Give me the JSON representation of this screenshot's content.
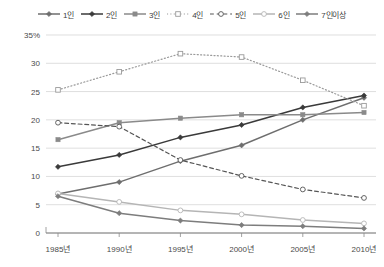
{
  "chart_data": {
    "type": "line",
    "title": "",
    "xlabel": "",
    "ylabel": "",
    "categories": [
      "1985년",
      "1990년",
      "1995년",
      "2000년",
      "2005년",
      "2010년"
    ],
    "x_values": [
      1985,
      1990,
      1995,
      2000,
      2005,
      2010
    ],
    "ylim": [
      0,
      35
    ],
    "yticks": [
      "0",
      "5",
      "10",
      "15",
      "20",
      "25",
      "30",
      "35%"
    ],
    "ytick_values": [
      0,
      5,
      10,
      15,
      20,
      25,
      30,
      35
    ],
    "grid": "horizontal",
    "legend_position": "top",
    "series": [
      {
        "name": "1인",
        "values": [
          6.9,
          9.0,
          12.7,
          15.5,
          20.0,
          23.9
        ],
        "color": "#6e6e6e",
        "style": "solid",
        "marker": "filled-diamond"
      },
      {
        "name": "2인",
        "values": [
          11.7,
          13.8,
          16.9,
          19.1,
          22.2,
          24.3
        ],
        "color": "#3a3a3a",
        "style": "solid",
        "marker": "filled-diamond"
      },
      {
        "name": "3인",
        "values": [
          16.5,
          19.5,
          20.3,
          20.9,
          20.9,
          21.3
        ],
        "color": "#8a8a8a",
        "style": "solid",
        "marker": "filled-square"
      },
      {
        "name": "4인",
        "values": [
          25.3,
          28.5,
          31.7,
          31.1,
          27.0,
          22.5
        ],
        "color": "#9a9a9a",
        "style": "dotted",
        "marker": "open-square"
      },
      {
        "name": "5인",
        "values": [
          19.5,
          18.8,
          12.9,
          10.1,
          7.7,
          6.2
        ],
        "color": "#555555",
        "style": "dashed",
        "marker": "open-circle"
      },
      {
        "name": "6인",
        "values": [
          7.0,
          5.5,
          4.0,
          3.3,
          2.3,
          1.7
        ],
        "color": "#b5b5b5",
        "style": "solid",
        "marker": "open-circle"
      },
      {
        "name": "7인이상",
        "values": [
          6.5,
          3.5,
          2.2,
          1.4,
          1.2,
          0.8
        ],
        "color": "#7d7d7d",
        "style": "solid",
        "marker": "filled-diamond"
      }
    ]
  }
}
